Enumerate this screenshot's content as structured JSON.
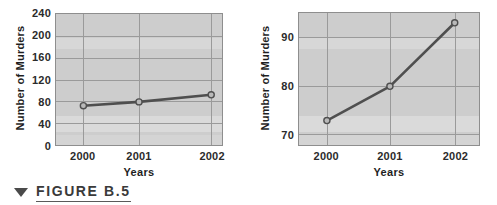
{
  "figure": {
    "marker_icon": "down-triangle-icon",
    "label": "FIGURE B.5"
  },
  "colors": {
    "plot_background": "#cdcdcd",
    "gridline": "#9a9a9a",
    "axis_frame": "#8e8e8e",
    "series_line": "#4f4f4f",
    "marker_fill": "#b9b9b9",
    "text": "#2b2b2b",
    "page_background": "#ffffff"
  },
  "chart_data": [
    {
      "id": "left-chart",
      "type": "line",
      "title": "",
      "xlabel": "Years",
      "ylabel": "Number of Murders",
      "categories": [
        "2000",
        "2001",
        "2002"
      ],
      "values": [
        72,
        79,
        92
      ],
      "yticks": [
        0,
        40,
        80,
        120,
        160,
        200,
        240
      ],
      "ytick_labels": [
        "0",
        "40",
        "80",
        "120",
        "160",
        "200",
        "240"
      ],
      "ylim": [
        0,
        240
      ],
      "grid": true,
      "legend": "none",
      "series": [
        {
          "name": "Number of Murders",
          "values": [
            72,
            79,
            92
          ]
        }
      ]
    },
    {
      "id": "right-chart",
      "type": "line",
      "title": "",
      "xlabel": "Years",
      "ylabel": "Number of Murders",
      "categories": [
        "2000",
        "2001",
        "2002"
      ],
      "values": [
        72,
        79,
        92
      ],
      "yticks": [
        70,
        80,
        90
      ],
      "ytick_labels": [
        "70",
        "80",
        "90"
      ],
      "ylim": [
        67,
        94
      ],
      "grid": true,
      "legend": "none",
      "series": [
        {
          "name": "Number of Murders",
          "values": [
            72,
            79,
            92
          ]
        }
      ]
    }
  ]
}
